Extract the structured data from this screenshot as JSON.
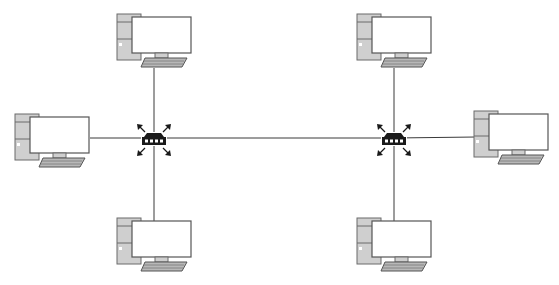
{
  "diagram": {
    "type": "network-topology",
    "colors": {
      "background": "#ffffff",
      "link": "#3a3a3a",
      "tower": "#cfcfcf",
      "outline": "#555555",
      "hub": "#1a1a1a"
    },
    "hubs": [
      {
        "id": "hub-left",
        "icon": "hub-icon",
        "x": 154,
        "y": 138
      },
      {
        "id": "hub-right",
        "icon": "hub-icon",
        "x": 394,
        "y": 138
      }
    ],
    "computers": [
      {
        "id": "pc-top-left",
        "icon": "desktop-computer-icon",
        "x": 117,
        "y": 14,
        "connects_to": "hub-left"
      },
      {
        "id": "pc-left",
        "icon": "desktop-computer-icon",
        "x": 15,
        "y": 114,
        "connects_to": "hub-left"
      },
      {
        "id": "pc-bottom-left",
        "icon": "desktop-computer-icon",
        "x": 117,
        "y": 218,
        "connects_to": "hub-left"
      },
      {
        "id": "pc-top-right",
        "icon": "desktop-computer-icon",
        "x": 357,
        "y": 14,
        "connects_to": "hub-right"
      },
      {
        "id": "pc-right",
        "icon": "desktop-computer-icon",
        "x": 474,
        "y": 111,
        "connects_to": "hub-right"
      },
      {
        "id": "pc-bottom-right",
        "icon": "desktop-computer-icon",
        "x": 357,
        "y": 218,
        "connects_to": "hub-right"
      }
    ],
    "links": [
      {
        "from": "hub-left",
        "to": "hub-right"
      },
      {
        "from": "hub-left",
        "to": "pc-top-left"
      },
      {
        "from": "hub-left",
        "to": "pc-left"
      },
      {
        "from": "hub-left",
        "to": "pc-bottom-left"
      },
      {
        "from": "hub-right",
        "to": "pc-top-right"
      },
      {
        "from": "hub-right",
        "to": "pc-right"
      },
      {
        "from": "hub-right",
        "to": "pc-bottom-right"
      }
    ]
  }
}
